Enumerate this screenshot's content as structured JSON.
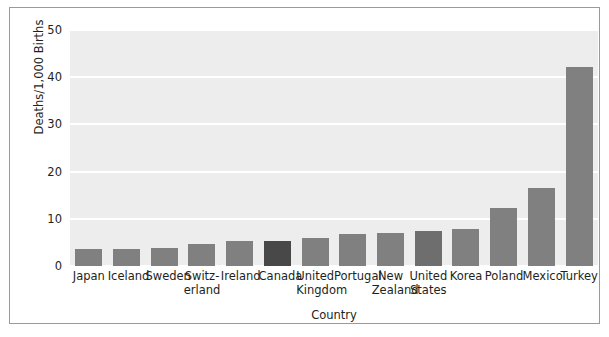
{
  "chart_data": {
    "type": "bar",
    "title": "",
    "xlabel": "Country",
    "ylabel": "Deaths/1,000 Births",
    "ylim": [
      0,
      50
    ],
    "yticks": [
      0,
      10,
      20,
      30,
      40,
      50
    ],
    "ytick_labels": [
      "0",
      "10",
      "20",
      "30",
      "40",
      "50"
    ],
    "grid": true,
    "legend": "none",
    "categories": [
      "Japan",
      "Iceland",
      "Sweden",
      "Switzerland",
      "Ireland",
      "Canada",
      "United Kingdom",
      "Portugal",
      "New Zealand",
      "United States",
      "Korea",
      "Poland",
      "Mexico",
      "Turkey"
    ],
    "category_label_lines": [
      [
        "Japan"
      ],
      [
        "Iceland"
      ],
      [
        "Sweden"
      ],
      [
        "Switz-",
        "erland"
      ],
      [
        "Ireland"
      ],
      [
        "Canada"
      ],
      [
        "United",
        "Kingdom"
      ],
      [
        "Portugal"
      ],
      [
        "New",
        "Zealand"
      ],
      [
        "United",
        "States"
      ],
      [
        "Korea"
      ],
      [
        "Poland"
      ],
      [
        "Mexico"
      ],
      [
        "Turkey"
      ]
    ],
    "values": [
      3.6,
      3.6,
      3.8,
      4.6,
      5.2,
      5.4,
      6.0,
      6.8,
      7.1,
      7.5,
      7.8,
      12.2,
      16.5,
      42.2
    ],
    "bar_colors": [
      "#808080",
      "#808080",
      "#808080",
      "#808080",
      "#808080",
      "#484848",
      "#808080",
      "#808080",
      "#808080",
      "#6e6e6e",
      "#808080",
      "#808080",
      "#808080",
      "#808080"
    ]
  },
  "style": {
    "plot_background": "#ededed",
    "gridline_color": "#ffffff",
    "frame_color": "#9a9a9a",
    "text_color": "#231f20",
    "default_bar_color": "#808080",
    "highlight_bar_color": "#484848"
  }
}
